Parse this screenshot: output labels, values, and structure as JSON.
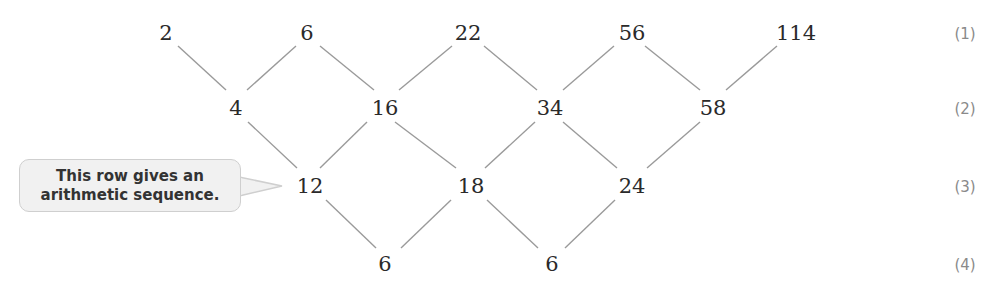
{
  "diagram": {
    "type": "difference-table",
    "rows": [
      {
        "label": "(1)",
        "values": [
          "2",
          "6",
          "22",
          "56",
          "114"
        ]
      },
      {
        "label": "(2)",
        "values": [
          "4",
          "16",
          "34",
          "58"
        ]
      },
      {
        "label": "(3)",
        "values": [
          "12",
          "18",
          "24"
        ]
      },
      {
        "label": "(4)",
        "values": [
          "6",
          "6"
        ]
      }
    ],
    "callout": {
      "line1": "This row gives an",
      "line2": "arithmetic sequence."
    }
  },
  "colors": {
    "text": "#2a2a2a",
    "lines": "#9a9a9a",
    "row_label": "#8a8a8a",
    "callout_bg": "#f1f1f1",
    "callout_border": "#cfcfcf"
  }
}
